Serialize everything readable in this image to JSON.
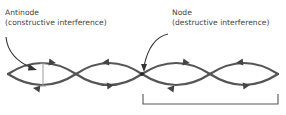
{
  "labels": {
    "antinode": {
      "title": "Antinode",
      "subtitle": "(constructive interference)"
    },
    "node": {
      "title": "Node",
      "subtitle": "(destructive interference)"
    }
  },
  "diagram": {
    "type": "standing-wave",
    "loops": 4,
    "colors": {
      "wave": "#555555",
      "pointer": "#333333",
      "amplitude_marker": "#999999",
      "bracket": "#555555",
      "text": "#444444"
    }
  }
}
